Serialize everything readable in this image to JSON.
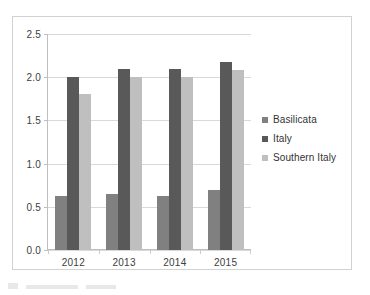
{
  "chart_data": {
    "type": "bar",
    "title": "",
    "subtitle": "",
    "xlabel": "",
    "ylabel": "",
    "categories": [
      "2012",
      "2013",
      "2014",
      "2015"
    ],
    "series": [
      {
        "name": "Basilicata",
        "color": "#808080",
        "values": [
          0.63,
          0.65,
          0.62,
          0.69
        ]
      },
      {
        "name": "Italy",
        "color": "#595959",
        "values": [
          2.0,
          2.09,
          2.09,
          2.18
        ]
      },
      {
        "name": "Southern Italy",
        "color": "#bfbfbf",
        "values": [
          1.8,
          2.0,
          2.0,
          2.08
        ]
      }
    ],
    "ylim": [
      0.0,
      2.5
    ],
    "ytick_labels": [
      "0.0",
      "0.5",
      "1.0",
      "1.5",
      "2.0",
      "2.5"
    ],
    "ytick_values": [
      0.0,
      0.5,
      1.0,
      1.5,
      2.0,
      2.5
    ],
    "grid": true,
    "legend_position": "right",
    "annotations": []
  }
}
